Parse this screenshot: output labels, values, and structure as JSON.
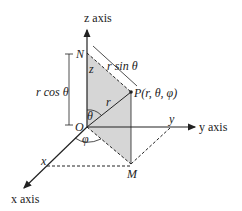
{
  "diagram": {
    "labels": {
      "z_axis": "z axis",
      "y_axis": "y axis",
      "x_axis": "x axis",
      "N": "N",
      "O": "O",
      "M": "M",
      "P": "P(r, θ, φ)",
      "z": "z",
      "y": "y",
      "x": "x",
      "r": "r",
      "theta": "θ",
      "phi": "φ",
      "r_sin_theta": "r sin θ",
      "r_cos_theta": "r cos θ"
    },
    "colors": {
      "shade": "#d6d6d6",
      "line": "#222222"
    }
  }
}
